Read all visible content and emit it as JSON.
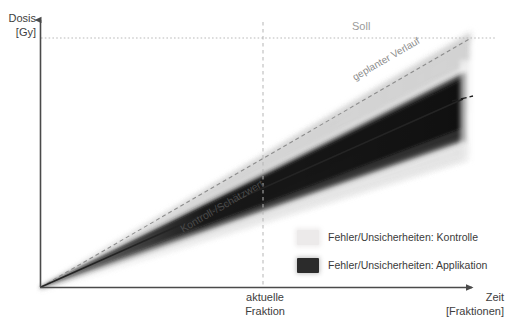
{
  "figure": {
    "type": "diagram",
    "axes": {
      "y": {
        "title": "Dosis",
        "unit": "[Gy]",
        "arrow": true
      },
      "x": {
        "title": "Zeit",
        "unit": "[Fraktionen]",
        "arrow": true
      }
    },
    "reference_lines": {
      "soll_label": "Soll",
      "soll_level_style": "dotted-horizontal",
      "planned_course_label": "geplanter Verlauf",
      "planned_course_style": "dashed-diagonal",
      "control_estimate_label": "Kontroll-/Schätzwert",
      "control_estimate_style": "solid-dark-diagonal"
    },
    "markers": {
      "current_fraction_label_line1": "aktuelle",
      "current_fraction_label_line2": "Fraktion",
      "current_fraction_style": "dashed-vertical"
    },
    "legend": {
      "items": [
        {
          "swatch": "light-gray",
          "label": "Fehler/Unsicherheiten: Kontrolle",
          "color": "#eceaea"
        },
        {
          "swatch": "dark",
          "label": "Fehler/Unsicherheiten: Applikation",
          "color": "#2b2b2b"
        }
      ]
    },
    "colors": {
      "axis": "#4a4a4a",
      "text": "#3a3a3a",
      "muted_text": "#9a9a9a",
      "uncertainty_light": "#eceaea",
      "uncertainty_dark": "#2b2b2b",
      "background": "#ffffff"
    }
  }
}
